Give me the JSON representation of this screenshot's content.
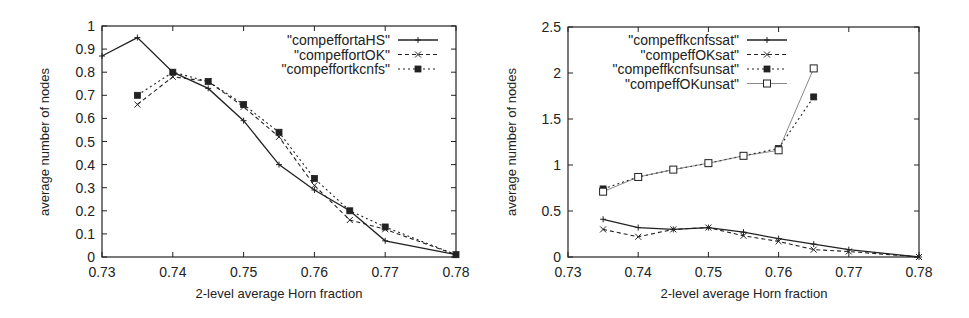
{
  "chart_data": [
    {
      "type": "line",
      "title": "",
      "xlabel": "2-level average Horn fraction",
      "ylabel": "average number of nodes",
      "xlim": [
        0.73,
        0.78
      ],
      "ylim": [
        0,
        1
      ],
      "xticks": [
        "0.73",
        "0.74",
        "0.75",
        "0.76",
        "0.77",
        "0.78"
      ],
      "yticks": [
        "0",
        "0.1",
        "0.2",
        "0.3",
        "0.4",
        "0.5",
        "0.6",
        "0.7",
        "0.8",
        "0.9",
        "1"
      ],
      "grid": false,
      "legend_position": "top-right",
      "series": [
        {
          "name": "\"compeffortaHS\"",
          "style": "solid",
          "marker": "plus",
          "x": [
            0.73,
            0.735,
            0.74,
            0.745,
            0.75,
            0.755,
            0.76,
            0.765,
            0.77,
            0.78
          ],
          "values": [
            0.87,
            0.95,
            0.8,
            0.73,
            0.59,
            0.4,
            0.29,
            0.2,
            0.07,
            0.01
          ]
        },
        {
          "name": "\"compeffortOK\"",
          "style": "dashed",
          "marker": "x",
          "x": [
            0.735,
            0.74,
            0.745,
            0.75,
            0.755,
            0.76,
            0.765,
            0.77,
            0.78
          ],
          "values": [
            0.66,
            0.78,
            0.76,
            0.65,
            0.52,
            0.31,
            0.16,
            0.12,
            0.01
          ]
        },
        {
          "name": "\"compeffortkcnfs\"",
          "style": "dotted",
          "marker": "filled-square",
          "x": [
            0.735,
            0.74,
            0.745,
            0.75,
            0.755,
            0.76,
            0.765,
            0.77,
            0.78
          ],
          "values": [
            0.7,
            0.8,
            0.76,
            0.66,
            0.54,
            0.34,
            0.2,
            0.13,
            0.01
          ]
        }
      ]
    },
    {
      "type": "line",
      "title": "",
      "xlabel": "2-level average Horn fraction",
      "ylabel": "average number of nodes",
      "xlim": [
        0.73,
        0.78
      ],
      "ylim": [
        0,
        2.5
      ],
      "xticks": [
        "0.73",
        "0.74",
        "0.75",
        "0.76",
        "0.77",
        "0.78"
      ],
      "yticks": [
        "0",
        "0.5",
        "1",
        "1.5",
        "2",
        "2.5"
      ],
      "grid": false,
      "legend_position": "top-center",
      "series": [
        {
          "name": "\"compeffkcnfssat\"",
          "style": "solid",
          "marker": "plus",
          "x": [
            0.735,
            0.74,
            0.745,
            0.75,
            0.755,
            0.76,
            0.765,
            0.77,
            0.78
          ],
          "values": [
            0.41,
            0.32,
            0.3,
            0.32,
            0.27,
            0.2,
            0.14,
            0.08,
            0.0
          ]
        },
        {
          "name": "\"compeffOKsat\"",
          "style": "dashed",
          "marker": "x",
          "x": [
            0.735,
            0.74,
            0.745,
            0.75,
            0.755,
            0.76,
            0.765,
            0.77,
            0.78
          ],
          "values": [
            0.3,
            0.22,
            0.3,
            0.32,
            0.23,
            0.17,
            0.08,
            0.06,
            0.0
          ]
        },
        {
          "name": "\"compeffkcnfsunsat\"",
          "style": "dotted",
          "marker": "filled-square",
          "x": [
            0.735,
            0.74,
            0.745,
            0.75,
            0.755,
            0.76,
            0.765
          ],
          "values": [
            0.74,
            0.87,
            0.95,
            1.02,
            1.1,
            1.18,
            1.74
          ]
        },
        {
          "name": "\"compeffOKunsat\"",
          "style": "thin-solid",
          "marker": "open-square",
          "x": [
            0.735,
            0.74,
            0.745,
            0.75,
            0.755,
            0.76,
            0.765
          ],
          "values": [
            0.71,
            0.87,
            0.95,
            1.02,
            1.1,
            1.16,
            2.05
          ]
        }
      ]
    }
  ]
}
